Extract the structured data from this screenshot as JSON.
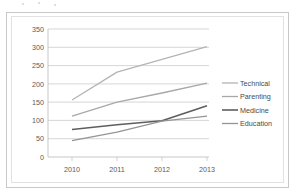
{
  "chart_data": {
    "type": "line",
    "title": "",
    "subtitle": "",
    "xlabel": "",
    "ylabel": "",
    "x": [
      "2010",
      "2011",
      "2012",
      "2013"
    ],
    "categories": [
      "2010",
      "2011",
      "2012",
      "2013"
    ],
    "ylim": [
      0,
      350
    ],
    "yticks": [
      "0",
      "50",
      "100",
      "150",
      "200",
      "250",
      "300",
      "350"
    ],
    "ytick_values": [
      0,
      50,
      100,
      150,
      200,
      250,
      300,
      350
    ],
    "grid": "horizontal",
    "legend_position": "right",
    "series": [
      {
        "name": "Technical",
        "color": "#b4b4b4",
        "values": [
          156,
          232,
          267,
          302
        ]
      },
      {
        "name": "Parenting",
        "color": "#a8a8a8",
        "values": [
          112,
          150,
          175,
          202
        ]
      },
      {
        "name": "Medicine",
        "color": "#5e5e5e",
        "values": [
          75,
          88,
          99,
          140
        ]
      },
      {
        "name": "Education",
        "color": "#949494",
        "values": [
          45,
          68,
          98,
          112
        ]
      }
    ]
  },
  "legend": {
    "items": [
      {
        "label": "Technical"
      },
      {
        "label": "Parenting"
      },
      {
        "label": "Medicine"
      },
      {
        "label": "Education"
      }
    ]
  },
  "axes": {
    "y_labels": [
      "350",
      "300",
      "250",
      "200",
      "150",
      "100",
      "50",
      "0"
    ],
    "x_labels": [
      "2010",
      "2011",
      "2012",
      "2013"
    ]
  },
  "colors": {
    "frame_border": "#c9c9c9",
    "inner_border": "#e2e2e2",
    "gridline": "#c4c4c4",
    "axis": "#b9b9b9",
    "tick_text": "#5a5a5a",
    "legend_text": "#4a4a4a",
    "plot_background": "#ffffff"
  }
}
